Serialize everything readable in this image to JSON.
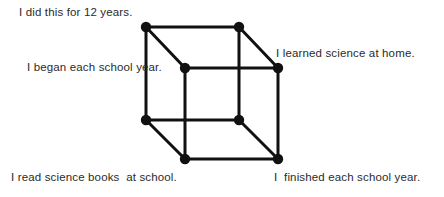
{
  "diagram": {
    "line_color": "#111111",
    "vertex_color": "#111111",
    "background_color": "#ffffff",
    "text_color": "#2b2b2b",
    "line_width": 3,
    "vertex_radius": 5,
    "vertices": [
      {
        "name": "back-top-left",
        "x": 146,
        "y": 27
      },
      {
        "name": "back-top-right",
        "x": 239,
        "y": 27
      },
      {
        "name": "front-top-left",
        "x": 185,
        "y": 68
      },
      {
        "name": "front-top-right",
        "x": 278,
        "y": 68
      },
      {
        "name": "back-bottom-left",
        "x": 146,
        "y": 120
      },
      {
        "name": "back-bottom-right",
        "x": 239,
        "y": 120
      },
      {
        "name": "front-bottom-left",
        "x": 185,
        "y": 159
      },
      {
        "name": "front-bottom-right",
        "x": 278,
        "y": 159
      }
    ],
    "edges": [
      {
        "from": "back-top-left",
        "to": "back-top-right"
      },
      {
        "from": "back-top-right",
        "to": "back-bottom-right"
      },
      {
        "from": "back-bottom-right",
        "to": "back-bottom-left"
      },
      {
        "from": "back-bottom-left",
        "to": "back-top-left"
      },
      {
        "from": "front-top-left",
        "to": "front-top-right"
      },
      {
        "from": "front-top-right",
        "to": "front-bottom-right"
      },
      {
        "from": "front-bottom-right",
        "to": "front-bottom-left"
      },
      {
        "from": "front-bottom-left",
        "to": "front-top-left"
      },
      {
        "from": "back-top-left",
        "to": "front-top-left"
      },
      {
        "from": "back-top-right",
        "to": "front-top-right"
      },
      {
        "from": "back-bottom-left",
        "to": "front-bottom-left"
      },
      {
        "from": "back-bottom-right",
        "to": "front-bottom-right"
      }
    ]
  },
  "labels": {
    "top_left": "I did this for 12 years.",
    "mid_left": "I began each school year.",
    "mid_right": "I learned science at home.",
    "bottom_left": "I read science books  at school.",
    "bottom_right": "I  finished each school year."
  }
}
